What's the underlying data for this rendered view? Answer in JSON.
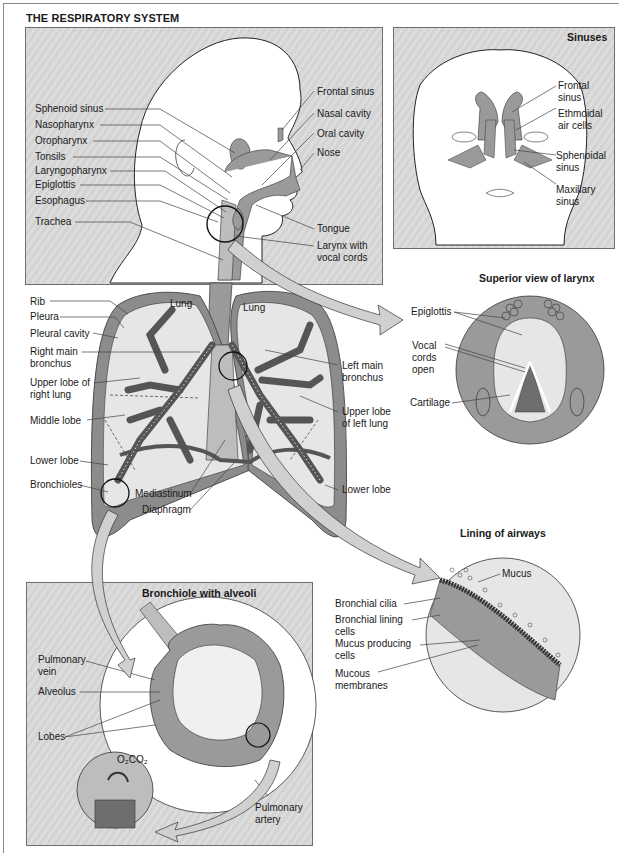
{
  "title": "THE RESPIRATORY SYSTEM",
  "colors": {
    "panel_bg": "#d6d6d6",
    "tissue": "#9a9a9a",
    "lung_fill": "#e6e6e6",
    "pleura": "#8c8c8c",
    "outline": "#222222",
    "leader": "#444444"
  },
  "head_panel": {
    "left_labels": [
      "Sphenoid sinus",
      "Nasopharynx",
      "Oropharynx",
      "Tonsils",
      "Laryngopharynx",
      "Epiglottis",
      "Esophagus",
      "Trachea"
    ],
    "right_labels": [
      "Frontal sinus",
      "Nasal cavity",
      "Oral cavity",
      "Nose",
      "Tongue",
      "Larynx with\nvocal cords"
    ]
  },
  "sinuses_panel": {
    "title": "Sinuses",
    "labels": [
      "Frontal\nsinus",
      "Ethmoidal\nair cells",
      "Sphenoidal\nsinus",
      "Maxillary\nsinus"
    ]
  },
  "lungs": {
    "lung_labels": [
      "Lung",
      "Lung"
    ],
    "left_labels": [
      "Rib",
      "Pleura",
      "Pleural cavity",
      "Right main\nbronchus",
      "Upper lobe of\nright lung",
      "Middle lobe",
      "Lower lobe",
      "Bronchioles"
    ],
    "bottom_labels": [
      "Mediastinum",
      "Diaphragm"
    ],
    "right_labels": [
      "Left main\nbronchus",
      "Upper lobe\nof left lung",
      "Lower lobe"
    ]
  },
  "larynx_view": {
    "title": "Superior view of larynx",
    "labels": [
      "Epiglottis",
      "Vocal\ncords\nopen",
      "Cartilage"
    ]
  },
  "airway_lining": {
    "title": "Lining of airways",
    "labels": [
      "Mucus",
      "Bronchial cilia",
      "Bronchial lining\ncells",
      "Mucus producing\ncells",
      "Mucous\nmembranes"
    ]
  },
  "alveoli_panel": {
    "title": "Bronchiole with alveoli",
    "labels": [
      "Pulmonary\nvein",
      "Alveolus",
      "Lobes",
      "Pulmonary\nartery"
    ],
    "gas_exchange": "O₂CO₂"
  }
}
